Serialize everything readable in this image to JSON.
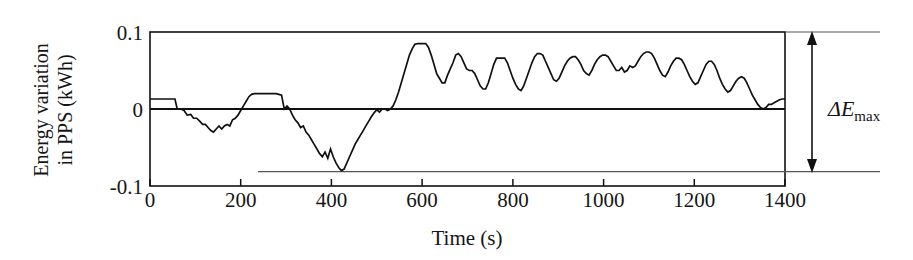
{
  "figure": {
    "title": "",
    "annotation_label_main": "ΔE",
    "annotation_label_sub": "max",
    "annotation_name": "delta-E-max"
  },
  "chart_data": {
    "type": "line",
    "title": "",
    "xlabel": "Time (s)",
    "ylabel": "Energy variation in PPS (kWh)",
    "ylabel_line1": "Energy variation",
    "ylabel_line2": "in PPS (kWh)",
    "xlim": [
      0,
      1400
    ],
    "ylim": [
      -0.1,
      0.1
    ],
    "xticks": [
      0,
      200,
      400,
      600,
      800,
      1000,
      1200,
      1400
    ],
    "xtick_labels": [
      "0",
      "200",
      "400",
      "600",
      "800",
      "1000",
      "1200",
      "1400"
    ],
    "yticks": [
      -0.1,
      0,
      0.1
    ],
    "ytick_labels": [
      "-0.1",
      "0",
      "0.1"
    ],
    "grid": false,
    "legend": false,
    "annotations": [
      {
        "name": "delta-E-max",
        "text": "ΔEmax",
        "type": "double-arrow",
        "y_from": -0.08,
        "y_to": 0.1,
        "x_position": 1460
      },
      {
        "name": "minimum-reference-line",
        "type": "horizontal-line",
        "y": -0.08,
        "x_from": 240,
        "x_to": 1400
      },
      {
        "name": "zero-reference-line",
        "type": "horizontal-line",
        "y": 0,
        "x_from": 0,
        "x_to": 1400
      }
    ],
    "series": [
      {
        "name": "Energy variation in PPS",
        "x": [
          0,
          10,
          20,
          30,
          40,
          50,
          55,
          60,
          68,
          75,
          82,
          90,
          96,
          103,
          110,
          116,
          122,
          128,
          134,
          140,
          146,
          152,
          158,
          164,
          170,
          176,
          182,
          188,
          194,
          200,
          206,
          212,
          218,
          224,
          230,
          236,
          242,
          248,
          254,
          260,
          266,
          272,
          278,
          284,
          290,
          296,
          302,
          308,
          314,
          320,
          326,
          332,
          338,
          344,
          350,
          356,
          362,
          368,
          374,
          380,
          386,
          392,
          398,
          404,
          410,
          416,
          422,
          428,
          434,
          440,
          446,
          452,
          458,
          464,
          470,
          476,
          482,
          488,
          494,
          500,
          506,
          512,
          518,
          524,
          530,
          536,
          542,
          548,
          554,
          560,
          566,
          572,
          578,
          584,
          590,
          596,
          602,
          608,
          614,
          620,
          626,
          632,
          638,
          644,
          650,
          656,
          662,
          668,
          674,
          680,
          686,
          692,
          698,
          704,
          710,
          716,
          722,
          728,
          734,
          740,
          746,
          752,
          758,
          764,
          770,
          776,
          782,
          788,
          794,
          800,
          806,
          812,
          818,
          824,
          830,
          836,
          842,
          848,
          854,
          860,
          866,
          872,
          878,
          884,
          890,
          896,
          902,
          908,
          914,
          920,
          926,
          932,
          938,
          944,
          950,
          956,
          962,
          968,
          974,
          980,
          986,
          992,
          998,
          1004,
          1010,
          1016,
          1022,
          1028,
          1034,
          1040,
          1046,
          1052,
          1058,
          1064,
          1070,
          1076,
          1082,
          1088,
          1094,
          1100,
          1106,
          1112,
          1118,
          1124,
          1130,
          1136,
          1142,
          1148,
          1154,
          1160,
          1166,
          1172,
          1178,
          1184,
          1190,
          1196,
          1202,
          1208,
          1214,
          1220,
          1226,
          1232,
          1238,
          1244,
          1250,
          1256,
          1262,
          1268,
          1274,
          1280,
          1286,
          1292,
          1298,
          1304,
          1310,
          1316,
          1322,
          1328,
          1334,
          1340,
          1346,
          1352,
          1358,
          1364,
          1370,
          1376,
          1382,
          1388,
          1394,
          1400
        ],
        "y": [
          0.013,
          0.013,
          0.013,
          0.013,
          0.013,
          0.013,
          0.013,
          0.0,
          0.0,
          -0.002,
          -0.008,
          -0.007,
          -0.012,
          -0.012,
          -0.016,
          -0.02,
          -0.02,
          -0.024,
          -0.028,
          -0.03,
          -0.026,
          -0.022,
          -0.026,
          -0.022,
          -0.02,
          -0.022,
          -0.014,
          -0.012,
          -0.008,
          -0.002,
          0.004,
          0.01,
          0.016,
          0.019,
          0.02,
          0.02,
          0.02,
          0.02,
          0.02,
          0.02,
          0.02,
          0.02,
          0.02,
          0.019,
          0.018,
          0.0,
          0.004,
          0.0,
          -0.008,
          -0.014,
          -0.018,
          -0.024,
          -0.022,
          -0.03,
          -0.034,
          -0.04,
          -0.046,
          -0.052,
          -0.058,
          -0.062,
          -0.056,
          -0.064,
          -0.052,
          -0.062,
          -0.07,
          -0.076,
          -0.08,
          -0.078,
          -0.07,
          -0.062,
          -0.054,
          -0.046,
          -0.04,
          -0.034,
          -0.028,
          -0.022,
          -0.016,
          -0.01,
          -0.005,
          -0.001,
          -0.004,
          0.0,
          0.0,
          -0.002,
          0.0,
          0.004,
          0.012,
          0.022,
          0.034,
          0.046,
          0.058,
          0.07,
          0.078,
          0.084,
          0.085,
          0.085,
          0.085,
          0.085,
          0.08,
          0.07,
          0.058,
          0.046,
          0.04,
          0.034,
          0.034,
          0.044,
          0.052,
          0.06,
          0.07,
          0.072,
          0.068,
          0.06,
          0.052,
          0.05,
          0.05,
          0.046,
          0.038,
          0.03,
          0.026,
          0.026,
          0.034,
          0.046,
          0.058,
          0.066,
          0.066,
          0.066,
          0.066,
          0.06,
          0.05,
          0.04,
          0.032,
          0.026,
          0.024,
          0.03,
          0.04,
          0.05,
          0.06,
          0.068,
          0.072,
          0.072,
          0.07,
          0.062,
          0.054,
          0.046,
          0.038,
          0.036,
          0.04,
          0.048,
          0.056,
          0.062,
          0.066,
          0.068,
          0.068,
          0.064,
          0.058,
          0.05,
          0.046,
          0.044,
          0.05,
          0.058,
          0.064,
          0.068,
          0.07,
          0.07,
          0.068,
          0.062,
          0.056,
          0.05,
          0.05,
          0.054,
          0.048,
          0.05,
          0.056,
          0.054,
          0.056,
          0.062,
          0.068,
          0.072,
          0.074,
          0.074,
          0.072,
          0.066,
          0.058,
          0.05,
          0.044,
          0.042,
          0.048,
          0.056,
          0.062,
          0.066,
          0.066,
          0.064,
          0.058,
          0.05,
          0.042,
          0.036,
          0.032,
          0.034,
          0.042,
          0.05,
          0.058,
          0.062,
          0.062,
          0.058,
          0.05,
          0.04,
          0.032,
          0.026,
          0.022,
          0.024,
          0.03,
          0.036,
          0.04,
          0.042,
          0.04,
          0.034,
          0.026,
          0.018,
          0.012,
          0.006,
          0.002,
          0.0,
          0.002,
          0.006,
          0.006,
          0.008,
          0.01,
          0.012,
          0.013,
          0.013
        ],
        "color": "#111111",
        "linewidth": 1.7
      }
    ],
    "notable_values": {
      "global_max": 0.097,
      "global_max_time": 960,
      "global_min": -0.08,
      "global_min_time": 240,
      "start_value": 0.013,
      "end_value": 0.013,
      "delta_e_max": 0.18
    }
  }
}
